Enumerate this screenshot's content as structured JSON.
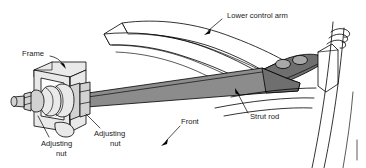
{
  "figure": {
    "kind": "technical-line-diagram",
    "background_color": "#ffffff",
    "line_color": "#000000",
    "rod_fill_color": "#8c8c8c",
    "bracket_fill_color": "#e9e9e9",
    "control_arm_fill_color": "#ffffff",
    "boss_fill_color": "#a8a8a8"
  },
  "labels": {
    "lower_control_arm": "Lower control arm",
    "frame": "Frame",
    "strut_rod": "Strut rod",
    "front": "Front",
    "adjusting_nut_left_line1": "Adjusting",
    "adjusting_nut_left_line2": "nut",
    "adjusting_nut_right_line1": "Adjusting",
    "adjusting_nut_right_line2": "nut"
  },
  "parts": [
    {
      "id": "lower-control-arm",
      "name": "Lower control arm",
      "fill": "#ffffff"
    },
    {
      "id": "strut-rod",
      "name": "Strut rod",
      "fill": "#8c8c8c"
    },
    {
      "id": "frame-bracket",
      "name": "Frame",
      "fill": "#e9e9e9"
    },
    {
      "id": "adjusting-nut-front",
      "name": "Adjusting nut",
      "fill": "#d2d2d2"
    },
    {
      "id": "adjusting-nut-rear",
      "name": "Adjusting nut",
      "fill": "#d2d2d2"
    },
    {
      "id": "bushing-stack",
      "name": "Bushing stack",
      "fill": "#e9e9e9"
    },
    {
      "id": "steering-knuckle",
      "name": "Steering knuckle",
      "fill": "#ffffff"
    },
    {
      "id": "wheel-outline",
      "name": "Wheel outline",
      "fill": "none"
    }
  ],
  "leaders": [
    {
      "id": "leader-lower-control-arm",
      "from_label": "Lower control arm",
      "direction": "down-left"
    },
    {
      "id": "leader-frame",
      "from_label": "Frame",
      "direction": "down-right"
    },
    {
      "id": "leader-strut-rod",
      "from_label": "Strut rod",
      "direction": "up-left"
    },
    {
      "id": "leader-front",
      "from_label": "Front",
      "direction": "down-left"
    },
    {
      "id": "leader-adjusting-nut-left",
      "from_label": "Adjusting nut",
      "direction": "up-right"
    },
    {
      "id": "leader-adjusting-nut-right",
      "from_label": "Adjusting nut",
      "direction": "up-left"
    }
  ]
}
